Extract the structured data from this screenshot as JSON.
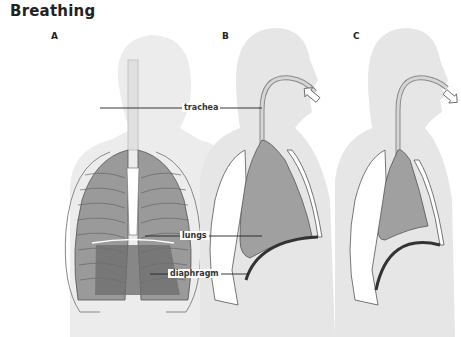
{
  "title": "Breathing",
  "panels": [
    {
      "id": "A",
      "label": "A",
      "view": "front view of chest with ribcage and lungs"
    },
    {
      "id": "B",
      "label": "B",
      "view": "side section, inhalation",
      "airflow": "in"
    },
    {
      "id": "C",
      "label": "C",
      "view": "side section, exhalation",
      "airflow": "out"
    }
  ],
  "labels": {
    "trachea": "trachea",
    "lungs": "lungs",
    "diaphragm": "diaphragm"
  },
  "colors": {
    "silhouette": "#e9e9e9",
    "lung": "#a9a9a9",
    "outline": "#555555",
    "diaphragm": "#3a3a3a"
  }
}
